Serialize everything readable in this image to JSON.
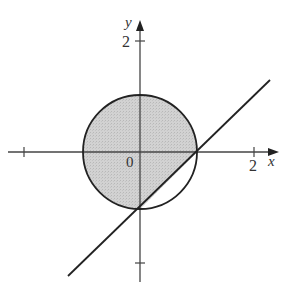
{
  "diagram": {
    "type": "coordinate-plot",
    "axes": {
      "x_label": "x",
      "y_label": "y",
      "origin_label": "0",
      "x_tick_label": "2",
      "y_tick_label": "2"
    },
    "shapes": {
      "circle": {
        "center": [
          0,
          0
        ],
        "radius": 1
      },
      "line": {
        "equation": "y = x - 1"
      }
    },
    "colors": {
      "shade": "#c8c8c8",
      "stroke": "#222222",
      "axis": "#444444"
    }
  }
}
